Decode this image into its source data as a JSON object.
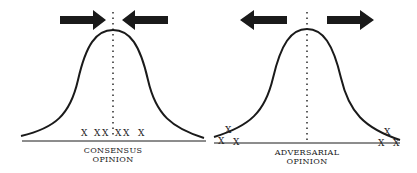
{
  "panels": [
    {
      "id": "consensus",
      "label_line1": "CONSENSUS",
      "label_line2": "OPINION",
      "arrows": "inward",
      "marker": "X",
      "markers": [
        "X",
        "X",
        "X",
        "X",
        "X",
        "X"
      ],
      "description": "Opinions clustered near center of bell curve"
    },
    {
      "id": "adversarial",
      "label_line1": "ADVERSARIAL",
      "label_line2": "OPINION",
      "arrows": "outward",
      "marker": "X",
      "markers": [
        "X",
        "X",
        "X",
        "X",
        "X",
        "X"
      ],
      "description": "Opinions pushed to the tails of bell curve"
    }
  ],
  "colors": {
    "ink": "#1a1a1a",
    "background": "#ffffff"
  }
}
